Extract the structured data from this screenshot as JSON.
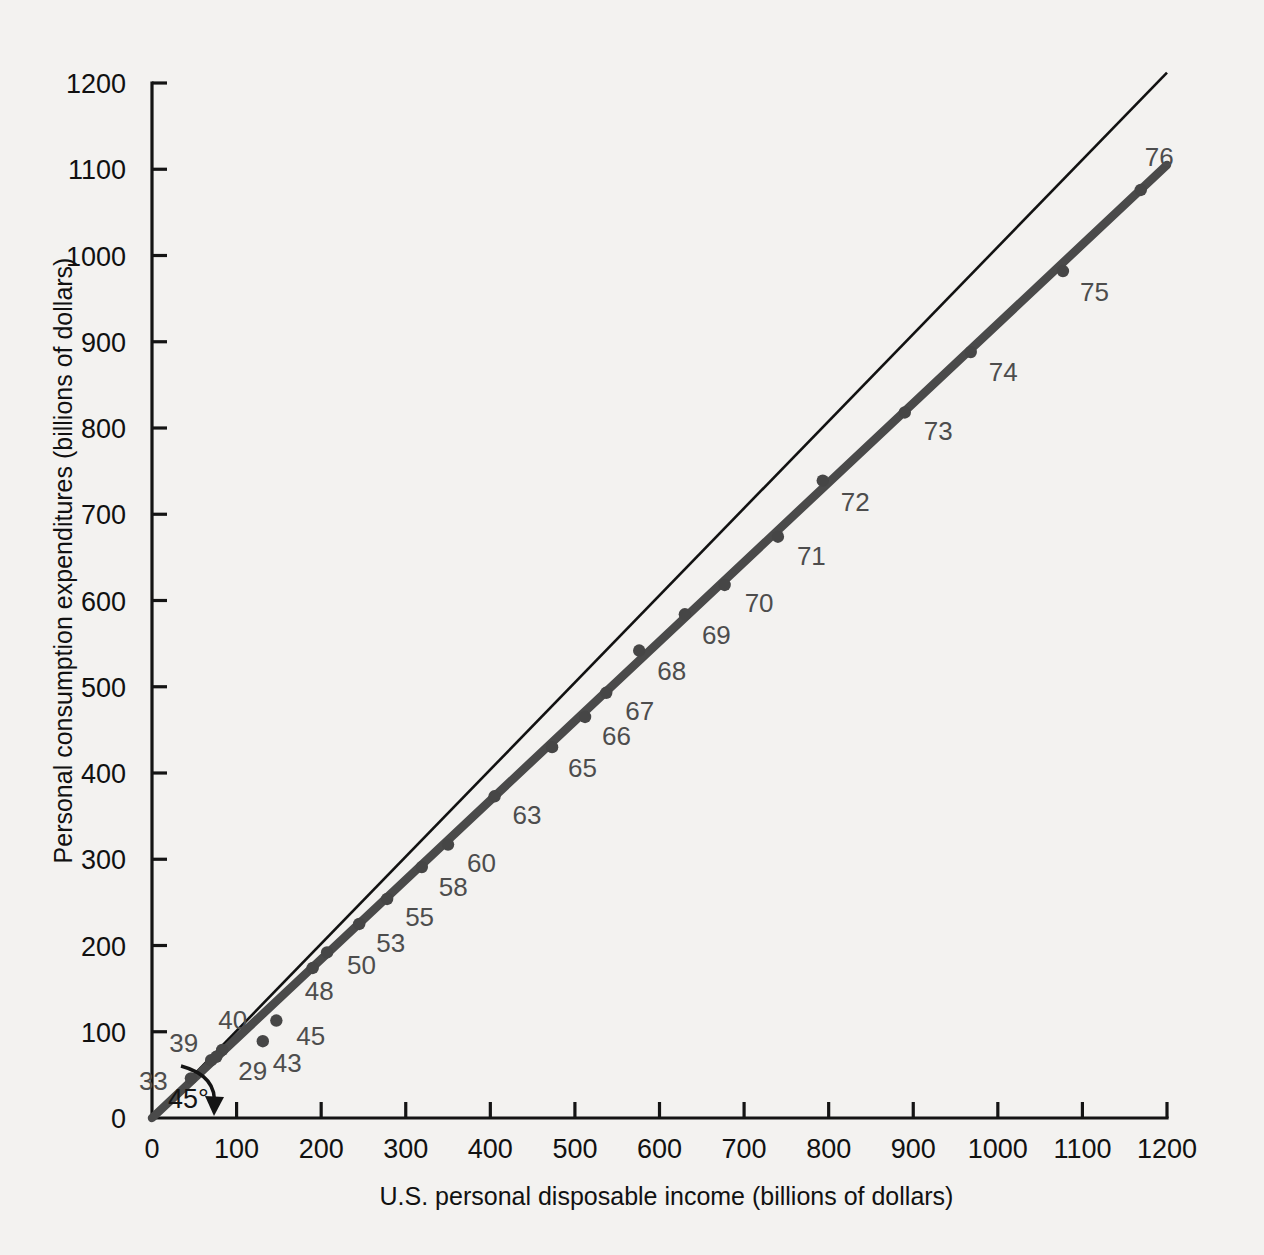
{
  "chart_data": {
    "type": "scatter",
    "title": "",
    "xlabel": "U.S. personal disposable income (billions of dollars)",
    "ylabel": "Personal consumption expenditures (billions of dollars)",
    "xlim": [
      0,
      1200
    ],
    "ylim": [
      0,
      1200
    ],
    "xticks": [
      0,
      100,
      200,
      300,
      400,
      500,
      600,
      700,
      800,
      900,
      1000,
      1100,
      1200
    ],
    "yticks": [
      0,
      100,
      200,
      300,
      400,
      500,
      600,
      700,
      800,
      900,
      1000,
      1100,
      1200
    ],
    "xtick_labels": [
      "0",
      "100",
      "200",
      "300",
      "400",
      "500",
      "600",
      "700",
      "800",
      "900",
      "1000",
      "1100",
      "1200"
    ],
    "ytick_labels": [
      "0",
      "100",
      "200",
      "300",
      "400",
      "500",
      "600",
      "700",
      "800",
      "900",
      "1000",
      "1100",
      "1200"
    ],
    "grid": false,
    "legend": null,
    "points": [
      {
        "label": "29",
        "x": 83,
        "y": 79,
        "label_dx": 16,
        "label_dy": 30
      },
      {
        "label": "33",
        "x": 46,
        "y": 46,
        "label_dx": -52,
        "label_dy": 12
      },
      {
        "label": "39",
        "x": 70,
        "y": 67,
        "label_dx": -42,
        "label_dy": -8
      },
      {
        "label": "40",
        "x": 76,
        "y": 71,
        "label_dx": 2,
        "label_dy": -28
      },
      {
        "label": "43",
        "x": 131,
        "y": 89,
        "label_dx": 10,
        "label_dy": 31
      },
      {
        "label": "45",
        "x": 147,
        "y": 113,
        "label_dx": 20,
        "label_dy": 24
      },
      {
        "label": "48",
        "x": 190,
        "y": 174,
        "label_dx": -8,
        "label_dy": 32
      },
      {
        "label": "50",
        "x": 207,
        "y": 192,
        "label_dx": 20,
        "label_dy": 22
      },
      {
        "label": "53",
        "x": 245,
        "y": 225,
        "label_dx": 17,
        "label_dy": 28
      },
      {
        "label": "55",
        "x": 278,
        "y": 254,
        "label_dx": 18,
        "label_dy": 27
      },
      {
        "label": "58",
        "x": 319,
        "y": 291,
        "label_dx": 17,
        "label_dy": 29
      },
      {
        "label": "60",
        "x": 350,
        "y": 317,
        "label_dx": 19,
        "label_dy": 27
      },
      {
        "label": "63",
        "x": 405,
        "y": 373,
        "label_dx": 18,
        "label_dy": 28
      },
      {
        "label": "65",
        "x": 473,
        "y": 430,
        "label_dx": 16,
        "label_dy": 30
      },
      {
        "label": "66",
        "x": 512,
        "y": 465,
        "label_dx": 17,
        "label_dy": 28
      },
      {
        "label": "67",
        "x": 537,
        "y": 493,
        "label_dx": 19,
        "label_dy": 27
      },
      {
        "label": "68",
        "x": 576,
        "y": 542,
        "label_dx": 18,
        "label_dy": 29
      },
      {
        "label": "69",
        "x": 630,
        "y": 584,
        "label_dx": 17,
        "label_dy": 30
      },
      {
        "label": "70",
        "x": 677,
        "y": 618,
        "label_dx": 20,
        "label_dy": 27
      },
      {
        "label": "71",
        "x": 740,
        "y": 674,
        "label_dx": 19,
        "label_dy": 28
      },
      {
        "label": "72",
        "x": 793,
        "y": 739,
        "label_dx": 18,
        "label_dy": 30
      },
      {
        "label": "73",
        "x": 890,
        "y": 818,
        "label_dx": 19,
        "label_dy": 28
      },
      {
        "label": "74",
        "x": 968,
        "y": 888,
        "label_dx": 18,
        "label_dy": 29
      },
      {
        "label": "75",
        "x": 1077,
        "y": 982,
        "label_dx": 17,
        "label_dy": 30
      },
      {
        "label": "76",
        "x": 1169,
        "y": 1076,
        "label_dx": 4,
        "label_dy": -24
      }
    ],
    "fit_line": {
      "name": "regression-line",
      "x1": 0,
      "y1": 0,
      "x2": 1200,
      "y2": 1105,
      "color": "#4a4a4a"
    },
    "reference_line": {
      "name": "45-degree-line",
      "x1": 0,
      "y1": 0,
      "x2": 1200,
      "y2": 1212,
      "color": "#121212"
    },
    "annotation": {
      "text": "45°",
      "x": 40,
      "y": 18
    }
  }
}
